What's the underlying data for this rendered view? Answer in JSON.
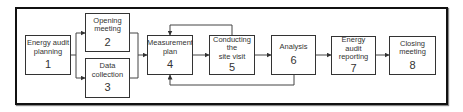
{
  "diagram": {
    "type": "flowchart",
    "colors": {
      "frame": "#111111",
      "box_border": "#333333",
      "text": "#333333",
      "background": "#ffffff"
    },
    "steps": [
      {
        "id": 1,
        "label": "Energy audit\nplanning",
        "number": "1"
      },
      {
        "id": 2,
        "label": "Opening\nmeeting",
        "number": "2"
      },
      {
        "id": 3,
        "label": "Data\ncollection",
        "number": "3"
      },
      {
        "id": 4,
        "label": "Measurement\nplan",
        "number": "4"
      },
      {
        "id": 5,
        "label": "Conducting\nthe\nsite visit",
        "number": "5"
      },
      {
        "id": 6,
        "label": "Analysis",
        "number": "6"
      },
      {
        "id": 7,
        "label": "Energy\naudit\nreporting",
        "number": "7"
      },
      {
        "id": 8,
        "label": "Closing\nmeeting",
        "number": "8"
      }
    ],
    "edges": [
      {
        "from": 1,
        "to": 2
      },
      {
        "from": 1,
        "to": 3
      },
      {
        "from": 2,
        "to": 4
      },
      {
        "from": 3,
        "to": 4
      },
      {
        "from": 4,
        "to": 5
      },
      {
        "from": 5,
        "to": 4,
        "type": "feedback-top"
      },
      {
        "from": 5,
        "to": 6
      },
      {
        "from": 6,
        "to": 4,
        "type": "feedback-bottom"
      },
      {
        "from": 6,
        "to": 7
      },
      {
        "from": 7,
        "to": 8
      }
    ]
  }
}
